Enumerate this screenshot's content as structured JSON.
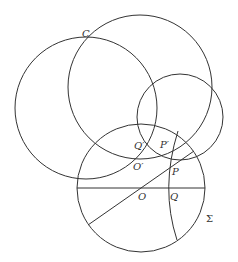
{
  "diagram": {
    "stroke_color": "#333333",
    "circles": [
      {
        "name": "left-circle",
        "cx": 86,
        "cy": 108,
        "r": 71
      },
      {
        "name": "upper-right-circle",
        "cx": 140,
        "cy": 87,
        "r": 72
      },
      {
        "name": "small-right-circle",
        "cx": 180,
        "cy": 117,
        "r": 43
      },
      {
        "name": "sigma-circle",
        "cx": 141,
        "cy": 188,
        "r": 64
      }
    ],
    "lines": [
      {
        "name": "horizontal-diameter",
        "x1": 77,
        "y1": 188,
        "x2": 205,
        "y2": 188
      },
      {
        "name": "diagonal-line",
        "x1": 88,
        "y1": 225,
        "x2": 194,
        "y2": 151
      }
    ],
    "labels": {
      "C": "C",
      "Q_prime": "Q′",
      "P_prime": "P′",
      "O_prime": "O′",
      "P": "P",
      "O": "O",
      "Q": "Q",
      "Sigma": "Σ"
    }
  }
}
